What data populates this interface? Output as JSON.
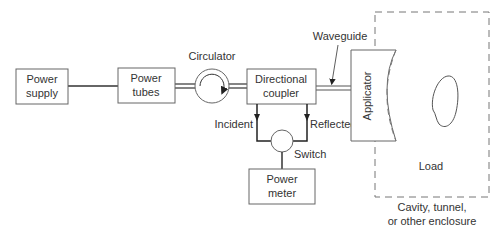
{
  "diagram": {
    "blocks": {
      "power_supply": [
        "Power",
        "supply"
      ],
      "power_tubes": [
        "Power",
        "tubes"
      ],
      "directional_coupler": [
        "Directional",
        "coupler"
      ],
      "power_meter": [
        "Power",
        "meter"
      ],
      "applicator": "Applicator"
    },
    "labels": {
      "circulator": "Circulator",
      "waveguide": "Waveguide",
      "incident": "Incident",
      "reflected": "Reflected",
      "switch": "Switch",
      "load": "Load",
      "enclosure": [
        "Cavity, tunnel,",
        "or other enclosure"
      ]
    },
    "colors": {
      "line": "#333333",
      "box_border": "#666666",
      "text": "#333333"
    }
  }
}
